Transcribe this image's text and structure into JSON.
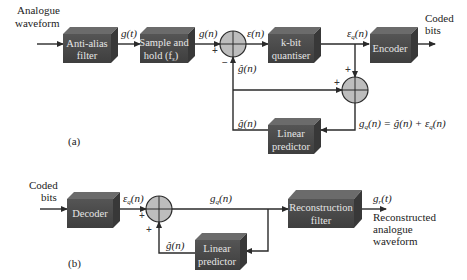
{
  "diagram": {
    "part_a": {
      "label": "(a)",
      "input_label_line1": "Analogue",
      "input_label_line2": "waveform",
      "output_label_line1": "Coded",
      "output_label_line2": "bits",
      "blocks": {
        "anti_alias_line1": "Anti-alias",
        "anti_alias_line2": "filter",
        "sample_hold_line1": "Sample and",
        "sample_hold_line2": "hold (f",
        "sample_hold_sub": "s",
        "sample_hold_close": ")",
        "quantiser_line1": "k-bit",
        "quantiser_line2": "quantiser",
        "encoder": "Encoder",
        "predictor_line1": "Linear",
        "predictor_line2": "predictor"
      },
      "signals": {
        "g_t": "g(t)",
        "g_n": "g(n)",
        "eps_n": "ε(n)",
        "eps_q_n": "ε",
        "eps_q_sub": "q",
        "eps_q_arg": "(n)",
        "g_hat_n_top": "ĝ(n)",
        "g_hat_n_bottom": "ĝ(n)",
        "equation": "g",
        "equation_sub": "q",
        "equation_rest": "(n) = ĝ(n) + ε",
        "equation_sub2": "q",
        "equation_end": "(n)"
      },
      "summer_signs": {
        "s1_left": "+",
        "s1_bottom": "−",
        "s2_top": "+",
        "s2_left": "+"
      }
    },
    "part_b": {
      "label": "(b)",
      "input_label_line1": "Coded",
      "input_label_line2": "bits",
      "output_label_line1": "Reconstructed",
      "output_label_line2": "analogue",
      "output_label_line3": "waveform",
      "blocks": {
        "decoder": "Decoder",
        "reconstruction_line1": "Reconstruction",
        "reconstruction_line2": "filter",
        "predictor_line1": "Linear",
        "predictor_line2": "predictor"
      },
      "signals": {
        "eps_q": "ε",
        "eps_q_sub": "q",
        "eps_q_arg": "(n)",
        "g_q": "g",
        "g_q_sub": "q",
        "g_q_arg": "(n)",
        "g_hat_n": "ĝ(n)",
        "g_r": "g",
        "g_r_sub": "r",
        "g_r_arg": "(t)"
      },
      "summer_signs": {
        "left": "+",
        "bottom": "+"
      }
    },
    "colors": {
      "box_front": "#4a4a4a",
      "box_top": "#6b6b6b",
      "box_side": "#383838",
      "summer_fill": "#bdbdbd",
      "wire": "#2a2a2a"
    }
  }
}
